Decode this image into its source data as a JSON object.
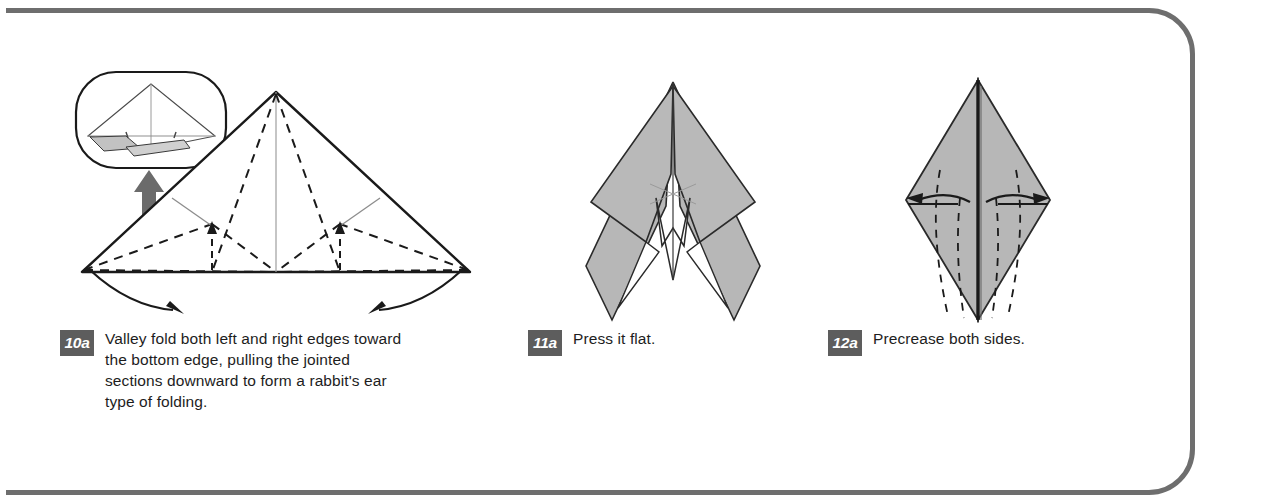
{
  "page": {
    "frame_color": "#6e6e6e",
    "background": "#ffffff"
  },
  "steps": [
    {
      "id": "10a",
      "badge": "10a",
      "text": "Valley fold both left and right edges toward the bottom edge, pulling the jointed sections downward to form a rabbit's ear type of folding.",
      "figure": {
        "name": "triangle-with-rabbit-ear-creases",
        "description": "Large wide triangle with dashed valley fold lines, a perspective inset bubble above-left connected by a thick gray arrow, and two curved arrows sweeping down from the bottom corners.",
        "inset": {
          "name": "perspective-inset-bubble",
          "description": "Rounded rectangle bubble showing a 3D perspective view of the folded model with small gray flaps."
        },
        "arrows": {
          "thick_gray_arrow": "points up into the inset bubble",
          "curved_arrows": 2,
          "small_up_arrows": 2
        }
      }
    },
    {
      "id": "11a",
      "badge": "11a",
      "text": "Press it flat.",
      "figure": {
        "name": "pressed-flat-arrow-shape",
        "description": "Narrow pointed arrow-like model with four shaded gray wing panels and a white notch at the centre bottom."
      }
    },
    {
      "id": "12a",
      "badge": "12a",
      "text": "Precrease both sides.",
      "figure": {
        "name": "diamond-precrease-shape",
        "description": "Tall gray diamond/kite with a dark vertical centre seam, dashed precrease lines on each half, and two horizontal double arrows pointing outward.",
        "arrows": {
          "double_arrows": 2
        }
      }
    }
  ],
  "colors": {
    "paper_fill": "#b5b5b5",
    "paper_fill_light": "#cfcfcf",
    "outline": "#1a1a1a",
    "badge_bg": "#5d5d5d",
    "badge_text": "#ffffff",
    "thick_arrow": "#6b6b6b",
    "frame": "#6e6e6e"
  }
}
